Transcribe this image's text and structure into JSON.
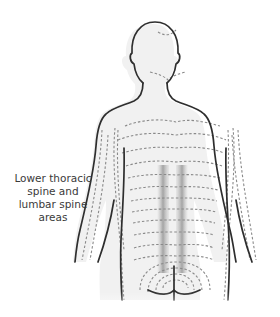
{
  "diagram": {
    "highlight_region": "spine",
    "label_lines": [
      "Lower thoracic",
      "spine and",
      "lumbar spine",
      "areas"
    ],
    "colors": {
      "outline": "#2e2e2e",
      "skin_fill": "#f1f1f1",
      "dashed_lines": "#8a8a8a",
      "highlight": "#8c8c8c",
      "label_text": "#3a3a3a"
    }
  }
}
